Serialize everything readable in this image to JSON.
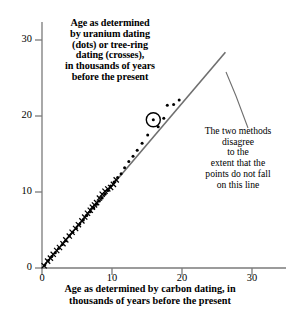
{
  "figure": {
    "background": "#ffffff",
    "ink_color": "#000000",
    "line_color": "#6b6b6b"
  },
  "title": {
    "lines": [
      "Age as determined",
      "by uranium dating",
      "(dots) or tree-ring",
      "dating (crosses),",
      "in thousands of years",
      "before the present"
    ]
  },
  "annotation": {
    "lines": [
      "The two methods",
      "disagree",
      "to the",
      "extent that the",
      "points do not fall",
      "on this line"
    ]
  },
  "xlabel": {
    "lines": [
      "Age as determined by carbon dating, in",
      "thousands of years before the present"
    ]
  },
  "axes": {
    "x_ticks": [
      "0",
      "10",
      "20",
      "30"
    ],
    "y_ticks": [
      "0",
      "10",
      "20",
      "30"
    ]
  },
  "chart_data": {
    "type": "scatter",
    "xlabel": "Age as determined by carbon dating, in thousands of years before the present",
    "ylabel": "Age as determined by uranium dating (dots) or tree-ring dating (crosses), in thousands of years before the present",
    "xlim": [
      0,
      32
    ],
    "ylim": [
      0,
      32
    ],
    "xticks": [
      0,
      10,
      20,
      30
    ],
    "yticks": [
      0,
      10,
      20,
      30
    ],
    "grid": false,
    "legend": "none",
    "annotations": [
      {
        "text": "The two methods disagree to the extent that the points do not fall on this line",
        "points_to": "identity-line"
      }
    ],
    "reference_line": {
      "name": "identity-line",
      "description": "y = x line of perfect agreement",
      "x": [
        0,
        26.2
      ],
      "y": [
        0,
        28.4
      ]
    },
    "highlight": {
      "description": "circled dot",
      "x": 15.9,
      "y": 19.5
    },
    "series": [
      {
        "name": "tree-ring dating",
        "marker": "cross",
        "x": [
          0.3,
          0.8,
          1.2,
          1.6,
          2.1,
          2.5,
          3.0,
          3.4,
          3.9,
          4.3,
          4.8,
          5.2,
          5.7,
          6.1,
          6.5,
          6.9,
          7.2,
          7.5,
          7.8,
          8.2,
          8.6,
          9.0,
          9.4,
          9.8,
          10.2,
          10.6
        ],
        "y": [
          0.3,
          0.9,
          1.3,
          1.8,
          2.3,
          2.7,
          3.2,
          3.7,
          4.2,
          4.7,
          5.2,
          5.7,
          6.2,
          6.7,
          7.2,
          7.6,
          8.0,
          8.3,
          8.6,
          9.2,
          9.7,
          10.1,
          10.4,
          10.6,
          11.0,
          11.6
        ]
      },
      {
        "name": "uranium dating",
        "marker": "dot",
        "x": [
          0.4,
          0.9,
          1.4,
          1.9,
          2.4,
          2.9,
          3.4,
          3.9,
          4.4,
          4.9,
          5.4,
          5.9,
          6.4,
          6.9,
          7.4,
          7.8,
          8.2,
          8.6,
          9.0,
          9.4,
          9.8,
          10.3,
          10.8,
          11.3,
          11.8,
          12.4,
          13.0,
          13.6,
          14.3,
          15.1,
          15.9,
          16.6,
          17.4,
          17.9,
          18.8,
          19.6
        ],
        "y": [
          0.4,
          1.0,
          1.5,
          2.0,
          2.6,
          3.1,
          3.6,
          4.2,
          4.7,
          5.2,
          5.8,
          6.3,
          6.9,
          7.4,
          7.9,
          8.4,
          8.8,
          9.2,
          9.7,
          10.2,
          10.8,
          11.3,
          11.9,
          12.4,
          13.2,
          14.0,
          14.7,
          15.5,
          16.4,
          17.5,
          19.5,
          18.6,
          19.7,
          21.4,
          21.5,
          22.1
        ]
      }
    ]
  }
}
